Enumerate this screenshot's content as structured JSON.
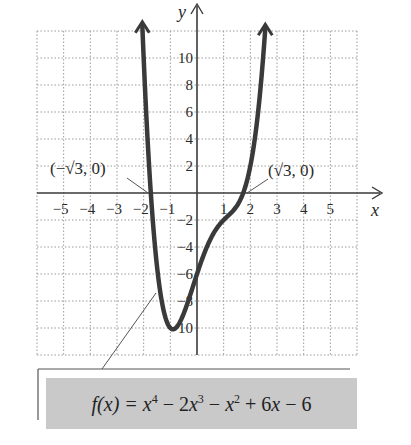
{
  "chart_data": {
    "type": "line",
    "title": "",
    "function": "f(x) = x^4 - 2x^3 - x^2 + 6x - 6",
    "coefficients": [
      1,
      -2,
      -1,
      6,
      -6
    ],
    "xlabel": "x",
    "ylabel": "y",
    "xlim": [
      -6,
      6
    ],
    "ylim": [
      -12,
      12
    ],
    "grid": true,
    "x_ticks": [
      -5,
      -4,
      -3,
      -2,
      -1,
      1,
      2,
      3,
      4,
      5
    ],
    "y_ticks": [
      -10,
      -8,
      -6,
      -4,
      -2,
      2,
      4,
      6,
      8,
      10
    ],
    "x": [
      -2.05,
      -1.9,
      -1.732,
      -1.5,
      -1.0,
      -0.8,
      -0.5,
      0,
      0.5,
      1.0,
      1.5,
      1.732,
      2.0,
      2.2,
      2.4,
      2.56
    ],
    "values": [
      12.39,
      5.74,
      0,
      -5.44,
      -10,
      -10.01,
      -8.94,
      -6,
      -3.44,
      -2,
      -0.94,
      0,
      2,
      4.49,
      7.85,
      12.21
    ],
    "annotations": [
      {
        "text": "(−√3, 0)",
        "x": -1.732,
        "y": 0
      },
      {
        "text": "(√3, 0)",
        "x": 1.732,
        "y": 0
      }
    ],
    "legend": "f(x) = x⁴ − 2x³ − x² + 6x − 6"
  },
  "labels": {
    "x_axis": "x",
    "y_axis": "y",
    "left_intercept": "(−√3, 0)",
    "right_intercept": "(√3, 0)"
  },
  "formula": {
    "lhs": "f(x) = ",
    "t1": "x",
    "e1": "4",
    "op1": " − 2",
    "t2": "x",
    "e2": "3",
    "op2": " − ",
    "t3": "x",
    "e3": "2",
    "op3": " + 6",
    "t4": "x",
    "op4": " − 6"
  },
  "colors": {
    "curve": "#3a3a3a",
    "axis": "#3a3a3a",
    "grid": "#9a9a9a",
    "formula_bg": "#c9c9c9"
  }
}
